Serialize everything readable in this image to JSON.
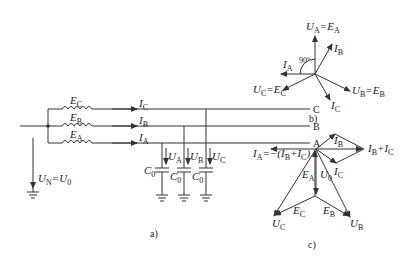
{
  "figure": {
    "panel_a": {
      "caption": "a)",
      "bus_labels": [
        "C",
        "B",
        "A"
      ],
      "sources": [
        {
          "sym": "E",
          "sub": "C"
        },
        {
          "sym": "E",
          "sub": "B"
        },
        {
          "sym": "E",
          "sub": "A"
        }
      ],
      "currents": [
        {
          "sym": "I",
          "sub": "C"
        },
        {
          "sym": "I",
          "sub": "B"
        },
        {
          "sym": "I",
          "sub": "A"
        }
      ],
      "voltages": [
        {
          "sym": "U",
          "sub": "A"
        },
        {
          "sym": "U",
          "sub": "B"
        },
        {
          "sym": "U",
          "sub": "C"
        }
      ],
      "capacitors": [
        {
          "sym": "C",
          "sub": "0"
        },
        {
          "sym": "C",
          "sub": "0"
        },
        {
          "sym": "C",
          "sub": "0"
        }
      ],
      "neutral_voltage": {
        "lhs": "U",
        "lhs_sub": "N",
        "eq": "=",
        "rhs": "U",
        "rhs_sub": "0"
      }
    },
    "panel_b": {
      "caption": "b)",
      "angle_label": "90°",
      "phasors": [
        {
          "label": "U_A = E_A"
        },
        {
          "label": "I_B"
        },
        {
          "label": "I_A"
        },
        {
          "label": "U_C = E_C"
        },
        {
          "label": "I_C"
        },
        {
          "label": "U_B = E_B"
        }
      ]
    },
    "panel_c": {
      "caption": "c)",
      "phasors": [
        {
          "label": "I_A = -(I_B + I_C)"
        },
        {
          "label": "I_B"
        },
        {
          "label": "I_B + I_C"
        },
        {
          "label": "I_C"
        },
        {
          "label": "E_A"
        },
        {
          "label": "U_0"
        },
        {
          "label": "E_C"
        },
        {
          "label": "E_B"
        },
        {
          "label": "U_C"
        },
        {
          "label": "U_B"
        }
      ]
    }
  }
}
